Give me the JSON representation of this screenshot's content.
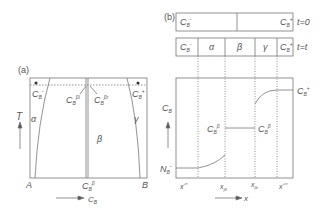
{
  "panel_a": {
    "label": "(a)",
    "y_axis": "T",
    "x_axis": "C_B",
    "x_left": "A",
    "x_right": "B",
    "x_mid": "C_B^β",
    "phases": [
      "α",
      "β",
      "γ"
    ],
    "top_left_point": "C_B^-",
    "top_right_point": "C_B^+",
    "arrow_left": "C_B^βl",
    "arrow_right": "C_B^βr"
  },
  "panel_b": {
    "label": "(b)",
    "row1": {
      "left": "C_B^-",
      "right": "C_B^+",
      "time": "t=0"
    },
    "row2": {
      "cells": [
        "C_B^-",
        "α",
        "β",
        "γ",
        "C_B^+"
      ],
      "time": "t=t"
    },
    "y_axis": "C_B",
    "x_axis": "x",
    "left_level": "N_B^-",
    "right_level": "C_B^+",
    "beta_left": "C_B^β",
    "beta_right": "C_B^β",
    "x_ticks": [
      "x^-∞",
      "x_βl",
      "x_βr",
      "x^+∞"
    ]
  }
}
